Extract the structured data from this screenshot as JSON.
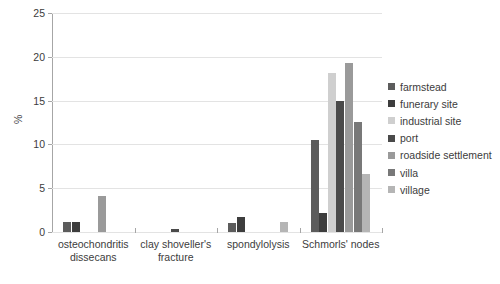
{
  "chart_data": {
    "type": "bar",
    "title": "",
    "subtitle": "",
    "xlabel": "",
    "ylabel": "%",
    "ylim": [
      0,
      25
    ],
    "ytick_step": 5,
    "yticks": [
      0,
      5,
      10,
      15,
      20,
      25
    ],
    "ytick_labels": [
      "0",
      "5",
      "10",
      "15",
      "20",
      "25"
    ],
    "grid": true,
    "legend_position": "right",
    "categories": [
      "osteochondritis dissecans",
      "clay shoveller's fracture",
      "spondylolysis",
      "Schmorls' nodes"
    ],
    "category_label_lines": [
      [
        "osteochondritis",
        "dissecans"
      ],
      [
        "clay shoveller's",
        "fracture"
      ],
      [
        "spondylolysis",
        ""
      ],
      [
        "Schmorls' nodes",
        ""
      ]
    ],
    "series": [
      {
        "name": "farmstead",
        "color": "#5c5c5c",
        "values": [
          1.2,
          0,
          1.0,
          10.5
        ]
      },
      {
        "name": "funerary site",
        "color": "#3d3d3d",
        "values": [
          1.1,
          0,
          1.7,
          2.2
        ]
      },
      {
        "name": "industrial site",
        "color": "#cfcfcf",
        "values": [
          0,
          0,
          0,
          18.1
        ]
      },
      {
        "name": "port",
        "color": "#4a4a4a",
        "values": [
          0,
          0.35,
          0,
          15.0
        ]
      },
      {
        "name": "roadside settlement",
        "color": "#9a9a9a",
        "values": [
          4.1,
          0,
          0,
          19.3
        ]
      },
      {
        "name": "villa",
        "color": "#787878",
        "values": [
          0,
          0,
          0,
          12.6
        ]
      },
      {
        "name": "village",
        "color": "#b5b5b5",
        "values": [
          0,
          0,
          1.1,
          6.6
        ]
      }
    ]
  },
  "legend": {
    "items": [
      {
        "label": "farmstead"
      },
      {
        "label": "funerary site"
      },
      {
        "label": "industrial site"
      },
      {
        "label": "port"
      },
      {
        "label": "roadside settlement"
      },
      {
        "label": "villa"
      },
      {
        "label": "village"
      }
    ]
  }
}
